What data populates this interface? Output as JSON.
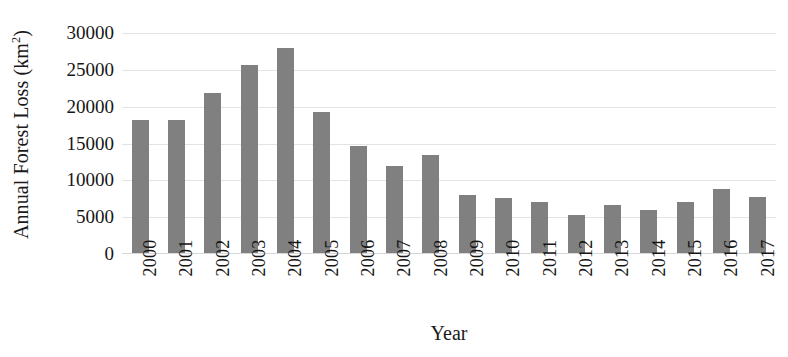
{
  "chart_data": {
    "type": "bar",
    "title": "",
    "subtitle": "",
    "xlabel": "Year",
    "ylabel": "Annual Forest Loss (km2)",
    "ylabel_base": "Annual Forest Loss (km",
    "ylabel_sup": "2",
    "ylabel_tail": ")",
    "categories": [
      "2000",
      "2001",
      "2002",
      "2003",
      "2004",
      "2005",
      "2006",
      "2007",
      "2008",
      "2009",
      "2010",
      "2011",
      "2012",
      "2013",
      "2014",
      "2015",
      "2016",
      "2017"
    ],
    "values": [
      18200,
      18200,
      21800,
      25600,
      28000,
      19300,
      14700,
      12000,
      13400,
      8000,
      7600,
      7100,
      5300,
      6600,
      6000,
      7100,
      8800,
      7700
    ],
    "ylim": [
      0,
      30000
    ],
    "yticks": [
      0,
      5000,
      10000,
      15000,
      20000,
      25000,
      30000
    ],
    "ytick_labels": [
      "0",
      "5000",
      "10000",
      "15000",
      "20000",
      "25000",
      "30000"
    ],
    "grid": true,
    "grid_axis": "y",
    "legend": false,
    "legend_position": "none",
    "bar_color": "#808080",
    "gridline_color": "#e3e3e3",
    "text_color": "#161616",
    "background_color": "#ffffff",
    "xtick_rotation": -90
  }
}
